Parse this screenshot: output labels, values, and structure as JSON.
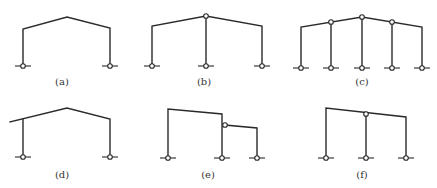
{
  "figure": {
    "panels": [
      {
        "id": "a",
        "label": "(a)",
        "label_pos": [
          62,
          76
        ],
        "members": [
          [
            [
              23,
              66
            ],
            [
              23,
              29
            ],
            [
              67,
              17
            ],
            [
              110,
              28
            ],
            [
              110,
              66
            ]
          ]
        ],
        "hinges": [],
        "supports": [
          [
            23,
            66
          ],
          [
            110,
            66
          ]
        ]
      },
      {
        "id": "b",
        "label": "(b)",
        "label_pos": [
          204,
          76
        ],
        "members": [
          [
            [
              152,
              66
            ],
            [
              152,
              26
            ],
            [
              206,
              16
            ],
            [
              262,
              26
            ],
            [
              262,
              66
            ]
          ],
          [
            [
              206,
              16
            ],
            [
              206,
              66
            ]
          ]
        ],
        "hinges": [
          [
            206,
            16
          ]
        ],
        "supports": [
          [
            152,
            66
          ],
          [
            206,
            66
          ],
          [
            262,
            66
          ]
        ]
      },
      {
        "id": "c",
        "label": "(c)",
        "label_pos": [
          362,
          76
        ],
        "members": [
          [
            [
              301,
              68
            ],
            [
              301,
              27
            ],
            [
              362,
              17
            ],
            [
              422,
              27
            ],
            [
              422,
              68
            ]
          ],
          [
            [
              331,
              22
            ],
            [
              331,
              68
            ]
          ],
          [
            [
              362,
              17
            ],
            [
              362,
              68
            ]
          ],
          [
            [
              392,
              22
            ],
            [
              392,
              68
            ]
          ]
        ],
        "hinges": [
          [
            331,
            22
          ],
          [
            362,
            17
          ],
          [
            392,
            22
          ]
        ],
        "supports": [
          [
            301,
            68
          ],
          [
            331,
            68
          ],
          [
            362,
            68
          ],
          [
            392,
            68
          ],
          [
            422,
            68
          ]
        ]
      },
      {
        "id": "d",
        "label": "(d)",
        "label_pos": [
          62,
          169
        ],
        "members": [
          [
            [
              10,
              122
            ],
            [
              67,
              108
            ],
            [
              110,
              119
            ],
            [
              110,
              157
            ]
          ],
          [
            [
              23,
              119
            ],
            [
              23,
              157
            ]
          ]
        ],
        "hinges": [],
        "supports": [
          [
            23,
            157
          ],
          [
            110,
            157
          ]
        ]
      },
      {
        "id": "e",
        "label": "(e)",
        "label_pos": [
          208,
          169
        ],
        "members": [
          [
            [
              168,
              158
            ],
            [
              168,
              109
            ],
            [
              222,
              114
            ],
            [
              222,
              158
            ]
          ],
          [
            [
              225,
              125
            ],
            [
              257,
              128
            ],
            [
              257,
              158
            ]
          ]
        ],
        "hinges": [
          [
            225,
            125
          ]
        ],
        "supports": [
          [
            168,
            158
          ],
          [
            222,
            158
          ],
          [
            257,
            158
          ]
        ]
      },
      {
        "id": "f",
        "label": "(f)",
        "label_pos": [
          362,
          169
        ],
        "members": [
          [
            [
              326,
              158
            ],
            [
              326,
              108
            ],
            [
              406,
              117
            ],
            [
              406,
              158
            ]
          ],
          [
            [
              366,
              114
            ],
            [
              366,
              158
            ]
          ]
        ],
        "hinges": [
          [
            366,
            114
          ]
        ],
        "supports": [
          [
            326,
            158
          ],
          [
            366,
            158
          ],
          [
            406,
            158
          ]
        ]
      }
    ]
  },
  "style": {
    "line_color": "#2a2a2a",
    "background": "#ffffff"
  }
}
